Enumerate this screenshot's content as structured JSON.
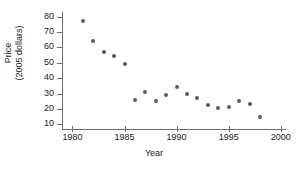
{
  "chart_data": {
    "type": "scatter",
    "title": "",
    "xlabel": "Year",
    "ylabel_line1": "Price",
    "ylabel_line2": "(2005 dollars)",
    "xlim": [
      1979,
      2000.5
    ],
    "ylim": [
      7,
      83
    ],
    "xticks": [
      1980,
      1985,
      1990,
      1995,
      2000
    ],
    "xtick_labels": [
      "1980",
      "1985",
      "1990",
      "1995",
      "2000"
    ],
    "yticks": [
      10,
      20,
      30,
      40,
      50,
      60,
      70,
      80
    ],
    "ytick_labels": [
      "10",
      "20",
      "30",
      "40",
      "50",
      "60",
      "70",
      "80"
    ],
    "grid": false,
    "legend": false,
    "marker_color": "#5b5b5b",
    "axis_color": "#6e6e6e",
    "x": [
      1981,
      1982,
      1983,
      1984,
      1985,
      1986,
      1987,
      1988,
      1989,
      1990,
      1991,
      1992,
      1993,
      1994,
      1995,
      1996,
      1997,
      1998
    ],
    "values": [
      77,
      64,
      57,
      54.5,
      49,
      26,
      31,
      25,
      29,
      34.5,
      29.5,
      27,
      22.5,
      20.5,
      21.5,
      25.5,
      23,
      14.5
    ],
    "points": [
      {
        "x": 1981,
        "y": 77
      },
      {
        "x": 1982,
        "y": 64
      },
      {
        "x": 1983,
        "y": 57
      },
      {
        "x": 1984,
        "y": 54.5
      },
      {
        "x": 1985,
        "y": 49
      },
      {
        "x": 1986,
        "y": 26
      },
      {
        "x": 1987,
        "y": 31
      },
      {
        "x": 1988,
        "y": 25
      },
      {
        "x": 1989,
        "y": 29
      },
      {
        "x": 1990,
        "y": 34.5
      },
      {
        "x": 1991,
        "y": 29.5
      },
      {
        "x": 1992,
        "y": 27
      },
      {
        "x": 1993,
        "y": 22.5
      },
      {
        "x": 1994,
        "y": 20.5
      },
      {
        "x": 1995,
        "y": 21.5
      },
      {
        "x": 1996,
        "y": 25.5
      },
      {
        "x": 1997,
        "y": 23
      },
      {
        "x": 1998,
        "y": 14.5
      }
    ]
  }
}
